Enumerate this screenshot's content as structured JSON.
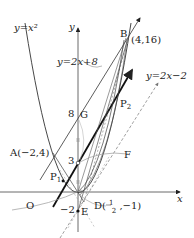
{
  "diagram": {
    "curves": {
      "parabola_label": "y=x²",
      "line_AB_label": "y=2x+8",
      "line_parallel_label": "y=2x−2"
    },
    "axes": {
      "x_label": "x",
      "y_label": "y",
      "origin_label": "O"
    },
    "points": {
      "A": "A(−2,4)",
      "B": "B",
      "B_coord": "(4,16)",
      "G": "G",
      "P1": "P",
      "P1_sub": "1",
      "P2": "P",
      "P2_sub": "2",
      "F": "F",
      "E": "E",
      "D_prefix": "D(",
      "D_num": "1",
      "D_den": "2",
      "D_suffix": ",−1)"
    },
    "ticks": {
      "y8": "8",
      "y3": "3",
      "ym2": "−2"
    },
    "colors": {
      "line": "#333333",
      "thick": "#111111",
      "dashed": "#777777",
      "guide": "#999999"
    }
  }
}
